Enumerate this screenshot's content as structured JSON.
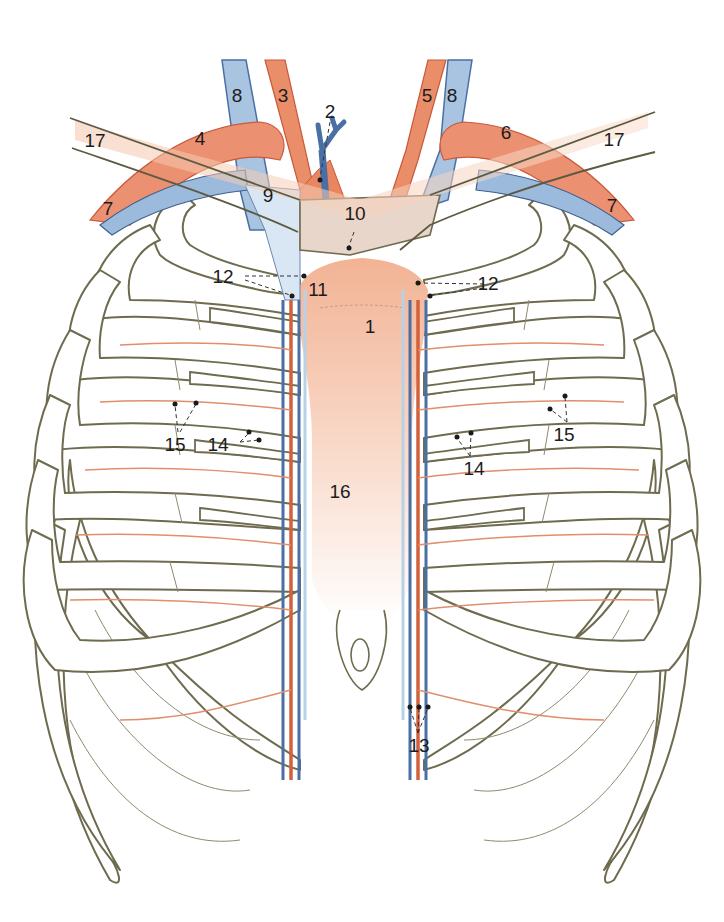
{
  "figure": {
    "colors": {
      "artery": "#e0714a",
      "artery_light": "#f4b396",
      "vein": "#4a6fa5",
      "vein_light": "#b9d1e6",
      "bone_outline": "#6e6b4e",
      "sternum": "#f6c7ae",
      "background": "#ffffff"
    },
    "labels": [
      {
        "id": "1",
        "text": "1",
        "x": 370,
        "y": 333,
        "structure": "sternum (manubrium)"
      },
      {
        "id": "2",
        "text": "2",
        "x": 330,
        "y": 118,
        "structure": "brachiocephalic trunk"
      },
      {
        "id": "3",
        "text": "3",
        "x": 283,
        "y": 102,
        "structure": "right common carotid artery"
      },
      {
        "id": "4",
        "text": "4",
        "x": 200,
        "y": 145,
        "structure": "right subclavian artery"
      },
      {
        "id": "5",
        "text": "5",
        "x": 427,
        "y": 102,
        "structure": "left common carotid artery"
      },
      {
        "id": "6",
        "text": "6",
        "x": 506,
        "y": 139,
        "structure": "left subclavian artery"
      },
      {
        "id": "7a",
        "text": "7",
        "x": 108,
        "y": 215,
        "structure": "subclavian vein (right)"
      },
      {
        "id": "7b",
        "text": "7",
        "x": 612,
        "y": 212,
        "structure": "subclavian vein (left)"
      },
      {
        "id": "8a",
        "text": "8",
        "x": 237,
        "y": 102,
        "structure": "internal jugular vein (right)"
      },
      {
        "id": "8b",
        "text": "8",
        "x": 452,
        "y": 102,
        "structure": "internal jugular vein (left)"
      },
      {
        "id": "9",
        "text": "9",
        "x": 268,
        "y": 202,
        "structure": "right brachiocephalic vein"
      },
      {
        "id": "10",
        "text": "10",
        "x": 355,
        "y": 220,
        "structure": "left brachiocephalic vein"
      },
      {
        "id": "11",
        "text": "11",
        "x": 318,
        "y": 296,
        "structure": "superior vena cava / pericardiacophrenic"
      },
      {
        "id": "12a",
        "text": "12",
        "x": 223,
        "y": 283,
        "structure": "internal thoracic artery & vein (right)"
      },
      {
        "id": "12b",
        "text": "12",
        "x": 488,
        "y": 290,
        "structure": "internal thoracic artery & vein (left)"
      },
      {
        "id": "13",
        "text": "13",
        "x": 419,
        "y": 752,
        "structure": "superior epigastric / musculophrenic vessels"
      },
      {
        "id": "14a",
        "text": "14",
        "x": 218,
        "y": 451,
        "structure": "perforating branches (right)"
      },
      {
        "id": "14b",
        "text": "14",
        "x": 474,
        "y": 475,
        "structure": "perforating branches (left)"
      },
      {
        "id": "15a",
        "text": "15",
        "x": 175,
        "y": 451,
        "structure": "anterior intercostal vessels (right)"
      },
      {
        "id": "15b",
        "text": "15",
        "x": 564,
        "y": 441,
        "structure": "anterior intercostal vessels (left)"
      },
      {
        "id": "16",
        "text": "16",
        "x": 340,
        "y": 498,
        "structure": "sternum (body)"
      },
      {
        "id": "17a",
        "text": "17",
        "x": 95,
        "y": 147,
        "structure": "clavicle (right)"
      },
      {
        "id": "17b",
        "text": "17",
        "x": 614,
        "y": 146,
        "structure": "clavicle (left)"
      }
    ]
  }
}
